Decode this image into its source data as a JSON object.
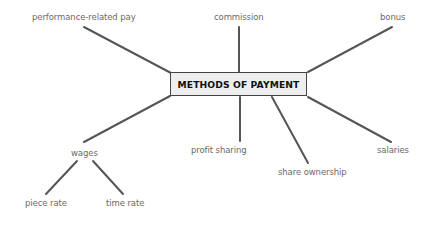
{
  "diagram": {
    "type": "mind-map",
    "center": {
      "label": "METHODS OF PAYMENT"
    },
    "nodes": [
      {
        "id": "performance",
        "label": "performance-related pay"
      },
      {
        "id": "commission",
        "label": "commission"
      },
      {
        "id": "bonus",
        "label": "bonus"
      },
      {
        "id": "wages",
        "label": "wages"
      },
      {
        "id": "profit",
        "label": "profit sharing"
      },
      {
        "id": "share",
        "label": "share ownership"
      },
      {
        "id": "salaries",
        "label": "salaries"
      },
      {
        "id": "piece",
        "label": "piece rate"
      },
      {
        "id": "time",
        "label": "time rate"
      }
    ],
    "edges": [
      [
        "METHODS OF PAYMENT",
        "performance-related pay"
      ],
      [
        "METHODS OF PAYMENT",
        "commission"
      ],
      [
        "METHODS OF PAYMENT",
        "bonus"
      ],
      [
        "METHODS OF PAYMENT",
        "wages"
      ],
      [
        "METHODS OF PAYMENT",
        "profit sharing"
      ],
      [
        "METHODS OF PAYMENT",
        "share ownership"
      ],
      [
        "METHODS OF PAYMENT",
        "salaries"
      ],
      [
        "wages",
        "piece rate"
      ],
      [
        "wages",
        "time rate"
      ]
    ],
    "colors": {
      "line": "#555555",
      "text": "#6a6a6a",
      "box_fill": "#eeeeee",
      "box_border": "#444444",
      "title": "#111111"
    }
  }
}
